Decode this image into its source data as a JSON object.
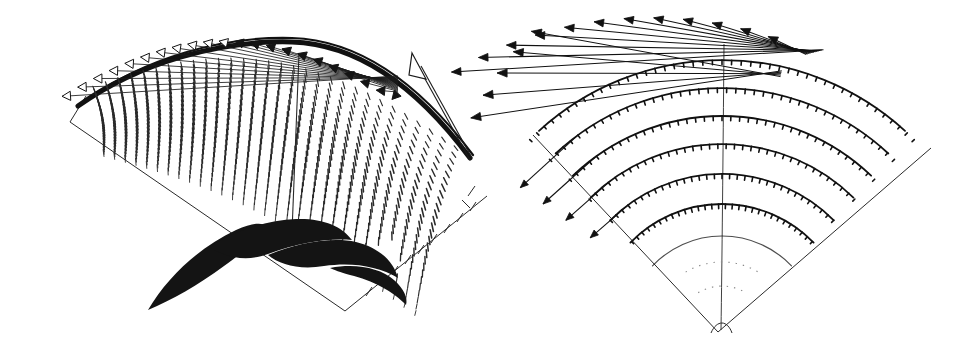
{
  "figure": {
    "domain": "Paper",
    "kind": "scientific-figure",
    "title": "",
    "background_color": "#ffffff",
    "ink_color": "#1a1a1a",
    "width": 974,
    "height": 342,
    "panel_count": 2
  },
  "panels": [
    {
      "id": "left-panel",
      "name": "velocity-vector-field-panel",
      "label": "",
      "plot_type": "vector-field",
      "glyph": "short-line-segment",
      "domain_shape": "curved-annular-sector",
      "features": [
        "dense grid of short line segments (hedgehog glyphs)",
        "bundle of long straight rays with hollow triangular arrowheads along the upper-left edge",
        "thick dark upper boundary arc",
        "dark solid wedge / blade silhouette at lower centre",
        "single large hollow outline arrow at upper right",
        "straight ruled boundary lines with tick marks at lower right",
        "near-vertical internal ridge line through centre-right"
      ],
      "glyph_rows": 26,
      "glyph_cols": 30,
      "arrowhead_style": "hollow-triangle",
      "arrow_count_top_edge": 22,
      "large_arrow": {
        "name": "resultant-vector-arrow",
        "style": "hollow-outline",
        "direction": "up-left"
      }
    },
    {
      "id": "right-panel",
      "name": "streamline-arc-panel",
      "label": "",
      "plot_type": "streamline-arcs",
      "glyph": "arc-with-tick-marks",
      "domain_shape": "circular-sector",
      "features": [
        "seven concentric circular arcs spanning the sector",
        "small perpendicular tick marks distributed along each arc",
        "long straight arrows with solid filled arrowheads radiating beyond the upper-left boundary",
        "straight radial sector edges meeting at a lower apex",
        "faint dotted arcs near the apex",
        "thin radial centre line through the sector bisector"
      ],
      "arc_count": 7,
      "escaping_arrow_count": 12,
      "arrowhead_style": "solid-triangle",
      "sector_opening_deg": 96,
      "apex_notch": true
    }
  ],
  "chart_data": {
    "type": "line",
    "title": "",
    "xlabel": "",
    "ylabel": "",
    "legend": [],
    "grid": false,
    "series": [
      {
        "name": "left-panel-vector-glyphs",
        "panel": "left-panel",
        "rows": 26,
        "cols": 30
      },
      {
        "name": "right-panel-arcs",
        "panel": "right-panel",
        "arc_radii": [
          96,
          128,
          158,
          188,
          216,
          244,
          272
        ],
        "arc_count": 7
      }
    ]
  }
}
